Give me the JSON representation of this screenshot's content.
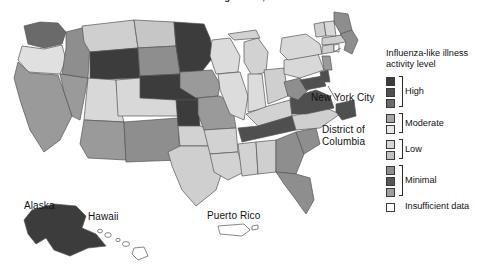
{
  "title": {
    "text": "2014-15 Influenza Season Week 5 ending Jan 31, 2015",
    "clipped": true
  },
  "chart_data": {
    "type": "heatmap",
    "subtype": "choropleth-map",
    "title": "2014-15 Influenza Season Week 5 ending Jan 31, 2015",
    "legend_title": "Influenza-like illness activity level",
    "legend_position": "right",
    "colorscale_note": "10 ordinal grayscale swatches grouped into 5 bracketed categories",
    "categories": [
      {
        "label": "High",
        "swatches": [
          "#3c3c3c",
          "#4f4f4f",
          "#6a6a6a"
        ]
      },
      {
        "label": "Moderate",
        "swatches": [
          "#a5a5a5",
          "#e2e2e2"
        ]
      },
      {
        "label": "Low",
        "swatches": [
          "#d2d2d2",
          "#bdbdbd"
        ]
      },
      {
        "label": "Minimal",
        "swatches": [
          "#8e8e8e",
          "#5a5a5a",
          "#9a9a9a"
        ]
      },
      {
        "label": "Insufficient data",
        "swatches": [
          "#ffffff"
        ]
      }
    ],
    "regions": [
      {
        "name": "Washington",
        "level": "High",
        "fill": "#6a6a6a"
      },
      {
        "name": "Oregon",
        "level": "Moderate",
        "fill": "#e0e0e0"
      },
      {
        "name": "California",
        "level": "Minimal",
        "fill": "#9a9a9a"
      },
      {
        "name": "Nevada",
        "level": "Minimal",
        "fill": "#9a9a9a"
      },
      {
        "name": "Idaho",
        "level": "Minimal",
        "fill": "#8e8e8e"
      },
      {
        "name": "Montana",
        "level": "Low",
        "fill": "#cfcfcf"
      },
      {
        "name": "Wyoming",
        "level": "High",
        "fill": "#3c3c3c"
      },
      {
        "name": "Utah",
        "level": "Low",
        "fill": "#d8d8d8"
      },
      {
        "name": "Arizona",
        "level": "Minimal",
        "fill": "#9a9a9a"
      },
      {
        "name": "Colorado",
        "level": "Low",
        "fill": "#d8d8d8"
      },
      {
        "name": "New Mexico",
        "level": "Minimal",
        "fill": "#8e8e8e"
      },
      {
        "name": "North Dakota",
        "level": "Low",
        "fill": "#c6c6c6"
      },
      {
        "name": "South Dakota",
        "level": "Minimal",
        "fill": "#8e8e8e"
      },
      {
        "name": "Nebraska",
        "level": "High",
        "fill": "#3c3c3c"
      },
      {
        "name": "Kansas",
        "level": "High",
        "fill": "#3c3c3c"
      },
      {
        "name": "Oklahoma",
        "level": "Low",
        "fill": "#d2d2d2"
      },
      {
        "name": "Texas",
        "level": "Low",
        "fill": "#cfcfcf"
      },
      {
        "name": "Minnesota",
        "level": "High",
        "fill": "#3c3c3c"
      },
      {
        "name": "Iowa",
        "level": "Minimal",
        "fill": "#9a9a9a"
      },
      {
        "name": "Missouri",
        "level": "Minimal",
        "fill": "#9a9a9a"
      },
      {
        "name": "Arkansas",
        "level": "Low",
        "fill": "#d2d2d2"
      },
      {
        "name": "Louisiana",
        "level": "Low",
        "fill": "#d2d2d2"
      },
      {
        "name": "Wisconsin",
        "level": "Moderate",
        "fill": "#dcdcdc"
      },
      {
        "name": "Illinois",
        "level": "Moderate",
        "fill": "#dcdcdc"
      },
      {
        "name": "Michigan",
        "level": "Low",
        "fill": "#d2d2d2"
      },
      {
        "name": "Indiana",
        "level": "Moderate",
        "fill": "#dcdcdc"
      },
      {
        "name": "Ohio",
        "level": "Low",
        "fill": "#cfcfcf"
      },
      {
        "name": "Kentucky",
        "level": "Low",
        "fill": "#d2d2d2"
      },
      {
        "name": "Tennessee",
        "level": "High",
        "fill": "#4f4f4f"
      },
      {
        "name": "Mississippi",
        "level": "Low",
        "fill": "#d2d2d2"
      },
      {
        "name": "Alabama",
        "level": "Low",
        "fill": "#cfcfcf"
      },
      {
        "name": "Georgia",
        "level": "Minimal",
        "fill": "#8e8e8e"
      },
      {
        "name": "Florida",
        "level": "Minimal",
        "fill": "#8e8e8e"
      },
      {
        "name": "South Carolina",
        "level": "Minimal",
        "fill": "#8e8e8e"
      },
      {
        "name": "North Carolina",
        "level": "Low",
        "fill": "#cfcfcf"
      },
      {
        "name": "Virginia",
        "level": "High",
        "fill": "#4f4f4f"
      },
      {
        "name": "West Virginia",
        "level": "Minimal",
        "fill": "#8e8e8e"
      },
      {
        "name": "Maryland",
        "level": "High",
        "fill": "#4f4f4f"
      },
      {
        "name": "Delaware",
        "level": "High",
        "fill": "#4f4f4f"
      },
      {
        "name": "Pennsylvania",
        "level": "Low",
        "fill": "#d8d8d8"
      },
      {
        "name": "New York",
        "level": "Low",
        "fill": "#d8d8d8"
      },
      {
        "name": "New Jersey",
        "level": "Minimal",
        "fill": "#9a9a9a"
      },
      {
        "name": "Connecticut",
        "level": "Low",
        "fill": "#cfcfcf"
      },
      {
        "name": "Rhode Island",
        "level": "Insufficient data",
        "fill": "#ffffff"
      },
      {
        "name": "Massachusetts",
        "level": "Low",
        "fill": "#cfcfcf"
      },
      {
        "name": "Vermont",
        "level": "Low",
        "fill": "#cfcfcf"
      },
      {
        "name": "New Hampshire",
        "level": "Low",
        "fill": "#d8d8d8"
      },
      {
        "name": "Maine",
        "level": "Minimal",
        "fill": "#8e8e8e"
      },
      {
        "name": "Alaska",
        "level": "High",
        "fill": "#3c3c3c"
      },
      {
        "name": "Hawaii",
        "level": "Insufficient data",
        "fill": "#ffffff"
      },
      {
        "name": "Puerto Rico",
        "level": "Insufficient data",
        "fill": "#ffffff"
      },
      {
        "name": "New York City",
        "level": "Minimal",
        "fill": "#8e8e8e"
      },
      {
        "name": "District of Columbia",
        "level": "High",
        "fill": "#4f4f4f"
      }
    ]
  },
  "map_labels": {
    "alaska": "Alaska",
    "hawaii": "Hawaii",
    "puerto_rico": "Puerto Rico",
    "new_york_city": "New York City",
    "district_of_columbia_line1": "District of",
    "district_of_columbia_line2": "Columbia"
  },
  "legend": {
    "title_line1": "Influenza-like illness",
    "title_line2": "activity level",
    "groups": [
      {
        "label": "High",
        "count": 3,
        "colors": [
          "#3c3c3c",
          "#4f4f4f",
          "#6a6a6a"
        ]
      },
      {
        "label": "Moderate",
        "count": 2,
        "colors": [
          "#a5a5a5",
          "#e8e8e8"
        ]
      },
      {
        "label": "Low",
        "count": 2,
        "colors": [
          "#d6d6d6",
          "#c0c0c0"
        ]
      },
      {
        "label": "Minimal",
        "count": 3,
        "colors": [
          "#8e8e8e",
          "#565656",
          "#9e9e9e"
        ]
      },
      {
        "label": "Insufficient data",
        "count": 1,
        "colors": [
          "#ffffff"
        ]
      }
    ]
  }
}
